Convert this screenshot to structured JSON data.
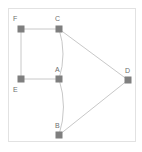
{
  "diagram": {
    "type": "node-link-graph",
    "background_color": "#ffffff",
    "frame": {
      "border_color": "#e2e2e2",
      "x": 8,
      "y": 8,
      "width": 128,
      "height": 134
    },
    "node_style": {
      "shape": "square",
      "fill_color": "#7f7f7f",
      "size": 7
    },
    "edge_style": {
      "stroke_color": "#c8c8c8",
      "stroke_width": 1
    },
    "label_style": {
      "color": "#6e6e6e",
      "font_size": 7
    },
    "nodes": [
      {
        "id": "F",
        "label": "F",
        "x": 21,
        "y": 29,
        "label_x": 13,
        "label_y": 15
      },
      {
        "id": "C",
        "label": "C",
        "x": 59,
        "y": 29,
        "label_x": 55,
        "label_y": 15
      },
      {
        "id": "A",
        "label": "A",
        "x": 59,
        "y": 79,
        "label_x": 55,
        "label_y": 66
      },
      {
        "id": "E",
        "label": "E",
        "x": 21,
        "y": 79,
        "label_x": 13,
        "label_y": 86
      },
      {
        "id": "B",
        "label": "B",
        "x": 59,
        "y": 135,
        "label_x": 55,
        "label_y": 122
      },
      {
        "id": "D",
        "label": "D",
        "x": 128,
        "y": 80,
        "label_x": 125,
        "label_y": 67
      }
    ],
    "edges": [
      {
        "id": "edge-F-C",
        "source": "F",
        "target": "C",
        "shape": "straight"
      },
      {
        "id": "edge-F-E",
        "source": "F",
        "target": "E",
        "shape": "straight"
      },
      {
        "id": "edge-E-A",
        "source": "E",
        "target": "A",
        "shape": "straight"
      },
      {
        "id": "edge-C-A",
        "source": "C",
        "target": "A",
        "shape": "curved",
        "curve_bulge": "right"
      },
      {
        "id": "edge-A-B",
        "source": "A",
        "target": "B",
        "shape": "curved",
        "curve_bulge": "right"
      },
      {
        "id": "edge-C-D",
        "source": "C",
        "target": "D",
        "shape": "straight"
      },
      {
        "id": "edge-B-D",
        "source": "B",
        "target": "D",
        "shape": "straight"
      }
    ]
  }
}
